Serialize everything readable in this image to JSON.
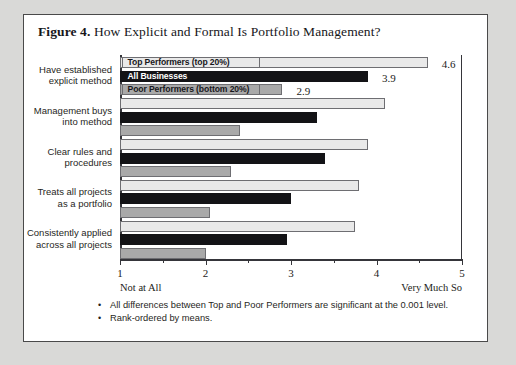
{
  "figure": {
    "number_label": "Figure 4.",
    "title": "How Explicit and Formal Is Portfolio Management?"
  },
  "footnotes": [
    "All differences between Top and Poor Performers are significant at the 0.001 level.",
    "Rank-ordered by means."
  ],
  "chart_data": {
    "type": "bar",
    "orientation": "horizontal",
    "title": "How Explicit and Formal Is Portfolio Management?",
    "xlabel": "",
    "ylabel": "",
    "xlim": [
      1,
      5
    ],
    "xticks": [
      1,
      2,
      3,
      4,
      5
    ],
    "xtick_labels": [
      "1",
      "2",
      "3",
      "4",
      "5"
    ],
    "minor_tick_interval": 0.5,
    "grid": false,
    "axis_low_caption": "Not at All",
    "axis_high_caption": "Very Much So",
    "legend_position": "top-left-overlay",
    "categories": [
      "Have established explicit method",
      "Management buys into method",
      "Clear rules and procedures",
      "Treats all projects as a portfolio",
      "Consistently applied across all projects"
    ],
    "category_lines": [
      [
        "Have established",
        "explicit method"
      ],
      [
        "Management buys",
        "into method"
      ],
      [
        "Clear rules and",
        "procedures"
      ],
      [
        "Treats all projects",
        "as a portfolio"
      ],
      [
        "Consistently applied",
        "across all projects"
      ]
    ],
    "series": [
      {
        "name": "Top Performers (top 20%)",
        "color": "#e9e9e9",
        "values": [
          4.6,
          4.1,
          3.9,
          3.8,
          3.75
        ]
      },
      {
        "name": "All Businesses",
        "color": "#131316",
        "values": [
          3.9,
          3.3,
          3.4,
          3.0,
          2.95
        ]
      },
      {
        "name": "Poor Performers (bottom 20%)",
        "color": "#a9a9a9",
        "values": [
          2.9,
          2.4,
          2.3,
          2.05,
          2.0
        ]
      }
    ],
    "value_labels": [
      {
        "series": "Top Performers (top 20%)",
        "category_index": 0,
        "text": "4.6"
      },
      {
        "series": "All Businesses",
        "category_index": 0,
        "text": "3.9"
      },
      {
        "series": "Poor Performers (bottom 20%)",
        "category_index": 0,
        "text": "2.9"
      }
    ]
  }
}
